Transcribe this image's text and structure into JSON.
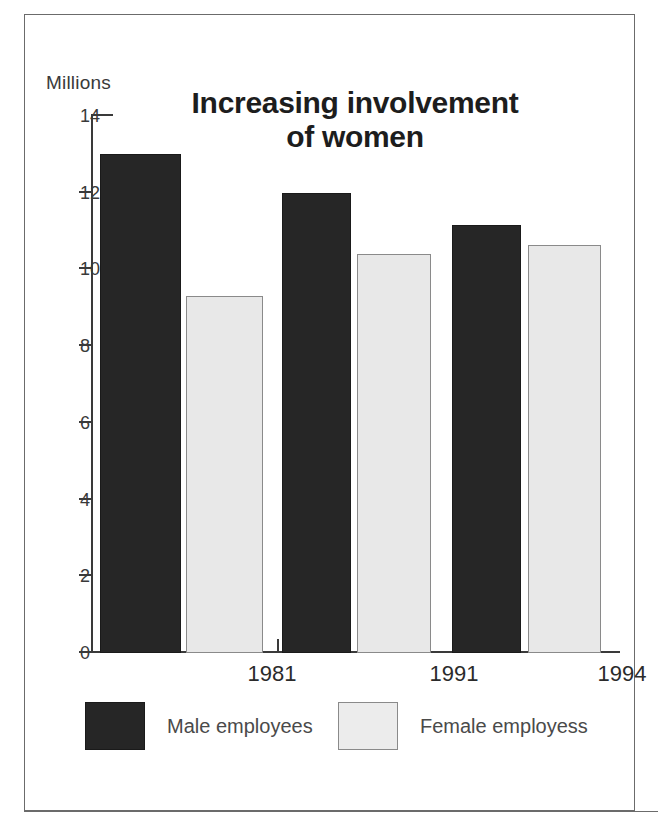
{
  "chart_data": {
    "type": "bar",
    "title": "Increasing involvement of women",
    "title_line1": "Increasing involvement",
    "title_line2": "of women",
    "xlabel": "",
    "ylabel": "Millions",
    "unit_label": "Millions",
    "categories": [
      "1981",
      "1991",
      "1994"
    ],
    "series": [
      {
        "name": "Male employees",
        "values": [
          13.0,
          12.0,
          11.15
        ],
        "color": "#262626"
      },
      {
        "name": "Female employess",
        "values": [
          9.3,
          10.4,
          10.65
        ],
        "color": "#e8e8e8"
      }
    ],
    "ylim": [
      0,
      14
    ],
    "yticks": [
      0,
      2,
      4,
      6,
      8,
      10,
      12,
      14
    ],
    "ytick_labels": [
      "0",
      "2",
      "4",
      "6",
      "8",
      "10",
      "12",
      "14"
    ],
    "grid": false,
    "legend_position": "bottom"
  },
  "legend": {
    "male_label": "Male employees",
    "female_label": "Female employess"
  },
  "colors": {
    "male_bar": "#262626",
    "female_bar": "#e8e8e8",
    "axis": "#3a3a3a",
    "frame": "#6b6b6b",
    "background": "#ffffff"
  }
}
